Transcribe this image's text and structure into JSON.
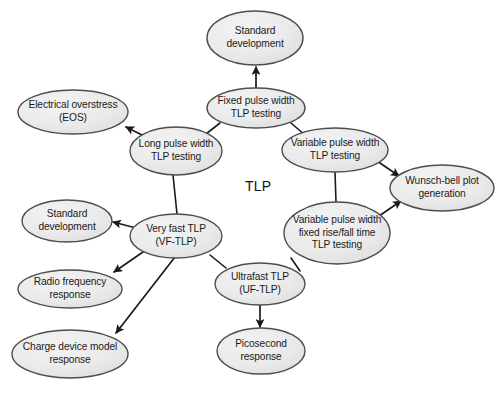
{
  "figure": {
    "type": "node-link-diagram",
    "background_color": "#ffffff",
    "node_fill_color": "#e9e9e9",
    "node_stroke_color": "#4d4d4d",
    "edge_color": "#1a1a1a",
    "center_label": "TLP"
  },
  "nodes": [
    {
      "id": "standard-development-top",
      "label": "Standard\ndevelopment",
      "cx": 255,
      "cy": 38,
      "rx": 48,
      "ry": 27
    },
    {
      "id": "electrical-overstress",
      "label": "Electrical overstress\n(EOS)",
      "cx": 73,
      "cy": 112,
      "rx": 55,
      "ry": 22
    },
    {
      "id": "fixed-pulse-width-tlp-testing",
      "label": "Fixed pulse width\nTLP testing",
      "cx": 256,
      "cy": 108,
      "rx": 49,
      "ry": 20
    },
    {
      "id": "long-pulse-width-tlp-testing",
      "label": "Long pulse width\nTLP testing",
      "cx": 176,
      "cy": 151,
      "rx": 46,
      "ry": 24
    },
    {
      "id": "variable-pulse-width-tlp-testing",
      "label": "Variable pulse width\nTLP testing",
      "cx": 335,
      "cy": 150,
      "rx": 53,
      "ry": 22
    },
    {
      "id": "wunsch-bell-plot-generation",
      "label": "Wunsch-bell plot\ngeneration",
      "cx": 442,
      "cy": 188,
      "rx": 52,
      "ry": 23
    },
    {
      "id": "standard-development-left",
      "label": "Standard\ndevelopment",
      "cx": 67,
      "cy": 221,
      "rx": 45,
      "ry": 21
    },
    {
      "id": "very-fast-tlp",
      "label": "Very fast TLP\n(VF-TLP)",
      "cx": 176,
      "cy": 236,
      "rx": 46,
      "ry": 22
    },
    {
      "id": "variable-pulse-width-fixed-rise-fall",
      "label": "Variable pulse width\nfixed rise/fall time\nTLP testing",
      "cx": 337,
      "cy": 233,
      "rx": 53,
      "ry": 31
    },
    {
      "id": "radio-frequency-response",
      "label": "Radio frequency\nresponse",
      "cx": 70,
      "cy": 289,
      "rx": 52,
      "ry": 19
    },
    {
      "id": "ultrafast-tlp",
      "label": "Ultrafast TLP\n(UF-TLP)",
      "cx": 260,
      "cy": 284,
      "rx": 45,
      "ry": 21
    },
    {
      "id": "charge-device-model-response",
      "label": "Charge device model\nresponse",
      "cx": 70,
      "cy": 354,
      "rx": 58,
      "ry": 24
    },
    {
      "id": "picosecond-response",
      "label": "Picosecond\nresponse",
      "cx": 261,
      "cy": 351,
      "rx": 44,
      "ry": 23
    }
  ],
  "edges": [
    {
      "id": "fixed-to-standard-development",
      "from": "fixed-pulse-width-tlp-testing",
      "to": "standard-development-top",
      "arrow": true,
      "x1": 256,
      "y1": 88,
      "x2": 256,
      "y2": 67
    },
    {
      "id": "long-to-electrical-overstress",
      "from": "long-pulse-width-tlp-testing",
      "to": "electrical-overstress",
      "arrow": true,
      "x1": 150,
      "y1": 139,
      "x2": 126,
      "y2": 127
    },
    {
      "id": "long-to-fixed",
      "from": "long-pulse-width-tlp-testing",
      "to": "fixed-pulse-width-tlp-testing",
      "arrow": false,
      "x1": 206,
      "y1": 134,
      "x2": 220,
      "y2": 123
    },
    {
      "id": "fixed-to-variable",
      "from": "fixed-pulse-width-tlp-testing",
      "to": "variable-pulse-width-tlp-testing",
      "arrow": false,
      "x1": 291,
      "y1": 123,
      "x2": 305,
      "y2": 135
    },
    {
      "id": "variable-to-wunsch-bell",
      "from": "variable-pulse-width-tlp-testing",
      "to": "wunsch-bell-plot-generation",
      "arrow": true,
      "x1": 377,
      "y1": 161,
      "x2": 399,
      "y2": 176
    },
    {
      "id": "variable-to-variable-fixed-rise-fall",
      "from": "variable-pulse-width-tlp-testing",
      "to": "variable-pulse-width-fixed-rise-fall",
      "arrow": false,
      "x1": 335,
      "y1": 172,
      "x2": 336,
      "y2": 202
    },
    {
      "id": "variable-fixed-rise-fall-to-wunsch-bell",
      "from": "variable-pulse-width-fixed-rise-fall",
      "to": "wunsch-bell-plot-generation",
      "arrow": true,
      "x1": 379,
      "y1": 216,
      "x2": 401,
      "y2": 201
    },
    {
      "id": "long-to-very-fast",
      "from": "long-pulse-width-tlp-testing",
      "to": "very-fast-tlp",
      "arrow": false,
      "x1": 173,
      "y1": 175,
      "x2": 177,
      "y2": 214
    },
    {
      "id": "very-fast-to-standard-development",
      "from": "very-fast-tlp",
      "to": "standard-development-left",
      "arrow": true,
      "x1": 136,
      "y1": 228,
      "x2": 113,
      "y2": 222
    },
    {
      "id": "very-fast-to-radio-frequency",
      "from": "very-fast-tlp",
      "to": "radio-frequency-response",
      "arrow": true,
      "x1": 143,
      "y1": 252,
      "x2": 114,
      "y2": 272
    },
    {
      "id": "very-fast-to-charge-device-model",
      "from": "very-fast-tlp",
      "to": "charge-device-model-response",
      "arrow": true,
      "x1": 175,
      "y1": 257,
      "x2": 116,
      "y2": 333
    },
    {
      "id": "very-fast-to-ultrafast",
      "from": "very-fast-tlp",
      "to": "ultrafast-tlp",
      "arrow": false,
      "x1": 210,
      "y1": 255,
      "x2": 226,
      "y2": 268
    },
    {
      "id": "variable-fixed-rise-fall-to-ultrafast",
      "from": "variable-pulse-width-fixed-rise-fall",
      "to": "ultrafast-tlp",
      "arrow": false,
      "x1": 291,
      "y1": 258,
      "x2": 300,
      "y2": 271
    },
    {
      "id": "ultrafast-to-picosecond",
      "from": "ultrafast-tlp",
      "to": "picosecond-response",
      "arrow": true,
      "x1": 260,
      "y1": 305,
      "x2": 260,
      "y2": 327
    }
  ]
}
